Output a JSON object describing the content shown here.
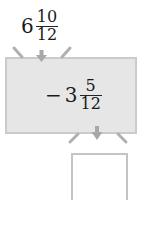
{
  "input": {
    "whole": "6",
    "numerator": "10",
    "denominator": "12"
  },
  "machine": {
    "operation": "−",
    "whole": "3",
    "numerator": "5",
    "denominator": "12",
    "fill_color": "#e6e6e6",
    "border_color": "#cbcbcb"
  },
  "output": {
    "value": ""
  },
  "arrow_color": "#a8a8a8"
}
